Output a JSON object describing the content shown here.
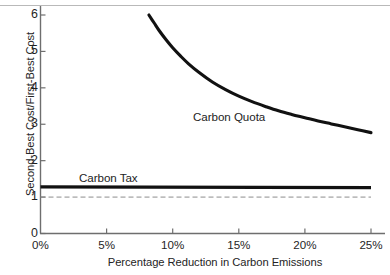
{
  "chart_data": {
    "type": "line",
    "title": "",
    "subtitle": "",
    "xlabel": "Percentage Reduction in Carbon Emissions",
    "ylabel": "Second-Best Cost/First-Best Cost",
    "xlim": [
      0,
      25
    ],
    "ylim": [
      0,
      6.3
    ],
    "grid": false,
    "legend_position": "inline-annotation",
    "xtick_labels": [
      "0%",
      "5%",
      "10%",
      "15%",
      "20%",
      "25%"
    ],
    "xtick_values": [
      0,
      5,
      10,
      15,
      20,
      25
    ],
    "ytick_labels": [
      "0",
      "1",
      "2",
      "3",
      "4",
      "5",
      "6"
    ],
    "ytick_values": [
      0,
      1,
      2,
      3,
      4,
      5,
      6
    ],
    "series": [
      {
        "name": "Carbon Quota",
        "style": "solid",
        "color": "#111111",
        "linewidth": 3.1,
        "x": [
          8.2,
          8.6,
          9.0,
          9.5,
          10.0,
          10.6,
          11.2,
          12.0,
          13.0,
          14.0,
          15.0,
          16.0,
          17.0,
          18.0,
          19.0,
          20.0,
          21.0,
          22.0,
          23.0,
          24.0,
          25.0
        ],
        "values": [
          6.0,
          5.78,
          5.56,
          5.32,
          5.1,
          4.87,
          4.66,
          4.42,
          4.16,
          3.95,
          3.77,
          3.62,
          3.49,
          3.37,
          3.27,
          3.18,
          3.09,
          3.01,
          2.93,
          2.85,
          2.77
        ]
      },
      {
        "name": "Carbon Tax",
        "style": "solid",
        "color": "#111111",
        "linewidth": 3.1,
        "x": [
          0,
          25
        ],
        "values": [
          1.28,
          1.26
        ]
      },
      {
        "name": "First-Best Reference",
        "style": "dashed",
        "color": "#8c8c8c",
        "linewidth": 1,
        "x": [
          0,
          25
        ],
        "values": [
          1.0,
          1.0
        ]
      }
    ],
    "annotations": [
      {
        "text": "Carbon Quota",
        "x": 13.0,
        "y": 3.3
      },
      {
        "text": "Carbon Tax",
        "x": 3.0,
        "y": 1.65
      }
    ]
  },
  "axes": {
    "y_title": "Second-Best Cost/First-Best Cost",
    "x_title": "Percentage Reduction in Carbon Emissions",
    "y_ticks": [
      "6",
      "5",
      "4",
      "3",
      "2",
      "1",
      "0"
    ],
    "x_ticks": [
      "0%",
      "5%",
      "10%",
      "15%",
      "20%",
      "25%"
    ]
  },
  "labels": {
    "quota": "Carbon Quota",
    "tax": "Carbon Tax"
  },
  "colors": {
    "line": "#111111",
    "dashed": "#8c8c8c",
    "axis": "#6e6e6e",
    "text": "#1f1f1f",
    "background": "#ffffff"
  }
}
